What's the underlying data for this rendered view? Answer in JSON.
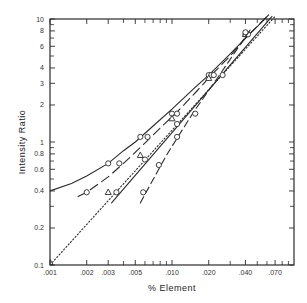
{
  "chart_data": {
    "type": "line",
    "title": "",
    "xlabel": "% Element",
    "ylabel": "Intensity Ratio",
    "xscale": "log",
    "yscale": "log",
    "xlim": [
      0.001,
      0.1
    ],
    "ylim": [
      0.1,
      10
    ],
    "grid": false,
    "legend": null,
    "x_tick_labels": [
      ".001",
      ".002",
      ".003",
      ".005",
      ".010",
      ".020",
      ".040",
      ".070"
    ],
    "x_ticks": [
      0.001,
      0.002,
      0.003,
      0.005,
      0.01,
      0.02,
      0.04,
      0.07
    ],
    "x_minor_ticks": [
      0.004,
      0.006,
      0.007,
      0.008,
      0.009,
      0.03,
      0.05,
      0.06,
      0.08,
      0.09
    ],
    "y_tick_labels": [
      "0.1",
      "0.2",
      "0.4",
      "0.6",
      "0.8",
      "1",
      "2",
      "3",
      "4",
      "6",
      "8",
      "10"
    ],
    "y_ticks": [
      0.1,
      0.2,
      0.4,
      0.6,
      0.8,
      1,
      2,
      3,
      4,
      6,
      8,
      10
    ],
    "y_minor_ticks": [
      0.3,
      0.5,
      0.7,
      0.9,
      5,
      7,
      9
    ],
    "series": [
      {
        "name": "curve-solid-bent",
        "style": "solid",
        "line": [
          [
            0.001,
            0.4
          ],
          [
            0.0015,
            0.46
          ],
          [
            0.002,
            0.53
          ],
          [
            0.003,
            0.67
          ],
          [
            0.004,
            0.85
          ],
          [
            0.005,
            1.0
          ],
          [
            0.007,
            1.35
          ],
          [
            0.01,
            1.85
          ],
          [
            0.015,
            2.7
          ],
          [
            0.02,
            3.5
          ],
          [
            0.03,
            5.2
          ],
          [
            0.04,
            7.0
          ],
          [
            0.055,
            9.5
          ],
          [
            0.062,
            10.8
          ]
        ],
        "marker": "circle",
        "points": [
          [
            0.003,
            0.67
          ],
          [
            0.0055,
            1.1
          ],
          [
            0.01,
            1.7
          ],
          [
            0.02,
            3.5
          ],
          [
            0.04,
            7.5
          ]
        ]
      },
      {
        "name": "curve-long-dash",
        "style": "dash",
        "line": [
          [
            0.0017,
            0.36
          ],
          [
            0.002,
            0.39
          ],
          [
            0.003,
            0.52
          ],
          [
            0.004,
            0.67
          ],
          [
            0.006,
            0.98
          ],
          [
            0.008,
            1.3
          ],
          [
            0.011,
            1.75
          ],
          [
            0.016,
            2.6
          ],
          [
            0.021,
            3.5
          ],
          [
            0.03,
            5.0
          ],
          [
            0.04,
            7.0
          ],
          [
            0.06,
            10.5
          ]
        ],
        "marker": "circle",
        "points": [
          [
            0.002,
            0.39
          ],
          [
            0.0037,
            0.67
          ],
          [
            0.0063,
            1.1
          ],
          [
            0.011,
            1.7
          ],
          [
            0.021,
            3.5
          ],
          [
            0.041,
            7.5
          ]
        ]
      },
      {
        "name": "line-dotted",
        "style": "dot",
        "line": [
          [
            0.001,
            0.1
          ],
          [
            0.07,
            10.5
          ]
        ],
        "marker": "triangle",
        "points": [
          [
            0.001,
            0.105
          ],
          [
            0.003,
            0.39
          ],
          [
            0.0055,
            0.78
          ],
          [
            0.01,
            1.55
          ],
          [
            0.02,
            3.3
          ],
          [
            0.04,
            7.5
          ]
        ]
      },
      {
        "name": "line-solid-straight",
        "style": "solid",
        "line": [
          [
            0.0032,
            0.32
          ],
          [
            0.066,
            10.5
          ]
        ],
        "marker": "circle",
        "points": [
          [
            0.0035,
            0.39
          ],
          [
            0.006,
            0.72
          ],
          [
            0.011,
            1.4
          ],
          [
            0.022,
            3.5
          ],
          [
            0.042,
            7.5
          ]
        ]
      },
      {
        "name": "line-steep-dash",
        "style": "dashdot",
        "line": [
          [
            0.0055,
            0.32
          ],
          [
            0.009,
            0.78
          ],
          [
            0.015,
            1.75
          ],
          [
            0.025,
            3.6
          ],
          [
            0.045,
            8.5
          ]
        ],
        "marker": "circle",
        "points": [
          [
            0.0058,
            0.39
          ],
          [
            0.0078,
            0.65
          ],
          [
            0.011,
            1.1
          ],
          [
            0.0155,
            1.7
          ],
          [
            0.026,
            3.5
          ],
          [
            0.04,
            7.8
          ]
        ]
      }
    ]
  },
  "colors": {
    "ink": "#2a2a2a",
    "background": "#ffffff",
    "tick_text": "#333333"
  }
}
